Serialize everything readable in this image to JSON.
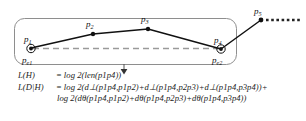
{
  "figure": {
    "kind": "trajectory-partition-mdl-diagram",
    "background_color": "#ffffff",
    "ink_color": "#111111",
    "box_stroke_color": "#888888",
    "dashed_line_color": "#999999"
  },
  "diagram": {
    "box_label": "trajectory-partition-box",
    "points": [
      {
        "id": "p1",
        "label": "p1",
        "x": 31,
        "y": 48,
        "marker": "circled-dot"
      },
      {
        "id": "p2",
        "label": "p2",
        "x": 93,
        "y": 34,
        "marker": "dot"
      },
      {
        "id": "p3",
        "label": "p3",
        "x": 148,
        "y": 29,
        "marker": "dot"
      },
      {
        "id": "p4",
        "label": "p4",
        "x": 221,
        "y": 49,
        "marker": "circled-dot"
      },
      {
        "id": "p5",
        "label": "p5",
        "x": 261,
        "y": 20,
        "marker": "dot"
      }
    ],
    "endpoint_labels": [
      {
        "id": "pe1",
        "label": "pe1",
        "x": 23,
        "y": 63
      },
      {
        "id": "pe2",
        "label": "pe2",
        "x": 213,
        "y": 63
      }
    ],
    "representative_line": {
      "name": "representative-dashed-segment",
      "from": "pe1",
      "to": "pe2",
      "style": "dashed"
    },
    "trailing_dotted_line": {
      "name": "trailing-dotted-line",
      "from_x": 265,
      "to_x": 300,
      "y": 20,
      "style": "dotted"
    },
    "arrow": {
      "name": "downward-arrow",
      "x": 124,
      "from_y": 64,
      "to_y": 73
    }
  },
  "formulas": {
    "line1": {
      "lhs": "L(H)",
      "eq": "=",
      "rhs": "log 2(len(p1p4))"
    },
    "line2": {
      "lhs": "L(D|H)",
      "eq": "=",
      "rhs": "log 2(d⊥(p1p4,p1p2)+d⊥(p1p4,p2p3)+d⊥(p1p4,p3p4))+"
    },
    "line3": {
      "lhs": "",
      "eq": "",
      "rhs": "log 2(dθ(p1p4,p1p2)+dθ(p1p4,p2p3)+dθ(p1p4,p3p4))"
    }
  }
}
